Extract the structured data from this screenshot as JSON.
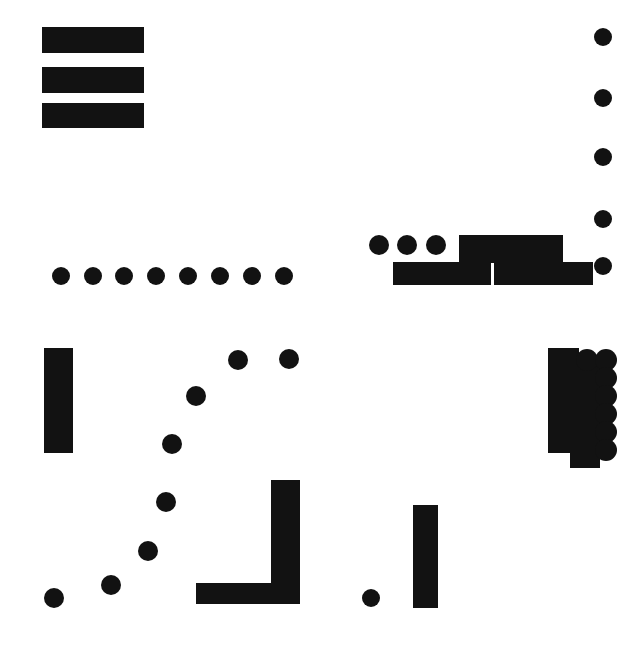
{
  "canvas": {
    "width": 642,
    "height": 649,
    "background_color": "#ffffff",
    "ink_color": "#121212",
    "description": "abstract black-on-white geometric composition of filled rectangles and filled circles"
  },
  "groups": [
    {
      "name": "top-left-bar-stack",
      "kind": "horizontal-bar-stack",
      "count": 3,
      "shapes": [
        {
          "type": "rect",
          "x": 42,
          "y": 27,
          "w": 102,
          "h": 26
        },
        {
          "type": "rect",
          "x": 42,
          "y": 67,
          "w": 102,
          "h": 26
        },
        {
          "type": "rect",
          "x": 42,
          "y": 103,
          "w": 102,
          "h": 25
        }
      ]
    },
    {
      "name": "right-edge-dot-column",
      "kind": "vertical-dot-column",
      "count": 5,
      "shapes": [
        {
          "type": "dot",
          "cx": 603,
          "cy": 37,
          "r": 9
        },
        {
          "type": "dot",
          "cx": 603,
          "cy": 98,
          "r": 9
        },
        {
          "type": "dot",
          "cx": 603,
          "cy": 157,
          "r": 9
        },
        {
          "type": "dot",
          "cx": 603,
          "cy": 219,
          "r": 9
        },
        {
          "type": "dot",
          "cx": 603,
          "cy": 266,
          "r": 9
        }
      ]
    },
    {
      "name": "middle-left-dot-row",
      "kind": "horizontal-dot-row",
      "count": 8,
      "shapes": [
        {
          "type": "dot",
          "cx": 61,
          "cy": 276,
          "r": 9
        },
        {
          "type": "dot",
          "cx": 93,
          "cy": 276,
          "r": 9
        },
        {
          "type": "dot",
          "cx": 124,
          "cy": 276,
          "r": 9
        },
        {
          "type": "dot",
          "cx": 156,
          "cy": 276,
          "r": 9
        },
        {
          "type": "dot",
          "cx": 188,
          "cy": 276,
          "r": 9
        },
        {
          "type": "dot",
          "cx": 220,
          "cy": 276,
          "r": 9
        },
        {
          "type": "dot",
          "cx": 252,
          "cy": 276,
          "r": 9
        },
        {
          "type": "dot",
          "cx": 284,
          "cy": 276,
          "r": 9
        }
      ]
    },
    {
      "name": "middle-right-bar-and-dot-cluster",
      "kind": "mixed-cluster",
      "count": 7,
      "shapes": [
        {
          "type": "dot",
          "cx": 379,
          "cy": 245,
          "r": 10
        },
        {
          "type": "dot",
          "cx": 407,
          "cy": 245,
          "r": 10
        },
        {
          "type": "dot",
          "cx": 436,
          "cy": 245,
          "r": 10
        },
        {
          "type": "rect",
          "x": 459,
          "y": 235,
          "w": 104,
          "h": 28
        },
        {
          "type": "rect",
          "x": 393,
          "y": 262,
          "w": 98,
          "h": 23
        },
        {
          "type": "rect",
          "x": 494,
          "y": 262,
          "w": 99,
          "h": 23
        }
      ]
    },
    {
      "name": "lower-left-vertical-bar",
      "kind": "vertical-bar",
      "count": 1,
      "shapes": [
        {
          "type": "rect",
          "x": 44,
          "y": 348,
          "w": 29,
          "h": 105
        }
      ]
    },
    {
      "name": "diagonal-dot-arc",
      "kind": "scatter-arc",
      "count": 8,
      "shapes": [
        {
          "type": "dot",
          "cx": 289,
          "cy": 359,
          "r": 10
        },
        {
          "type": "dot",
          "cx": 238,
          "cy": 360,
          "r": 10
        },
        {
          "type": "dot",
          "cx": 196,
          "cy": 396,
          "r": 10
        },
        {
          "type": "dot",
          "cx": 172,
          "cy": 444,
          "r": 10
        },
        {
          "type": "dot",
          "cx": 166,
          "cy": 502,
          "r": 10
        },
        {
          "type": "dot",
          "cx": 148,
          "cy": 551,
          "r": 10
        },
        {
          "type": "dot",
          "cx": 111,
          "cy": 585,
          "r": 10
        },
        {
          "type": "dot",
          "cx": 54,
          "cy": 598,
          "r": 10
        }
      ]
    },
    {
      "name": "bottom-center-l-shape",
      "kind": "l-shape",
      "count": 2,
      "shapes": [
        {
          "type": "rect",
          "x": 271,
          "y": 480,
          "w": 29,
          "h": 124
        },
        {
          "type": "rect",
          "x": 196,
          "y": 583,
          "w": 104,
          "h": 21
        }
      ]
    },
    {
      "name": "bottom-center-small-dot",
      "kind": "dot",
      "count": 1,
      "shapes": [
        {
          "type": "dot",
          "cx": 371,
          "cy": 598,
          "r": 9
        }
      ]
    },
    {
      "name": "bottom-right-vertical-bar",
      "kind": "vertical-bar",
      "count": 1,
      "shapes": [
        {
          "type": "rect",
          "x": 413,
          "y": 505,
          "w": 25,
          "h": 103
        }
      ]
    },
    {
      "name": "right-block-and-dot-column-cluster",
      "kind": "mixed-cluster",
      "count": 9,
      "shapes": [
        {
          "type": "rect",
          "x": 548,
          "y": 348,
          "w": 31,
          "h": 105
        },
        {
          "type": "rect",
          "x": 570,
          "y": 360,
          "w": 30,
          "h": 108
        },
        {
          "type": "dot",
          "cx": 587,
          "cy": 360,
          "r": 11
        },
        {
          "type": "dot",
          "cx": 606,
          "cy": 360,
          "r": 11
        },
        {
          "type": "dot",
          "cx": 606,
          "cy": 378,
          "r": 11
        },
        {
          "type": "dot",
          "cx": 606,
          "cy": 396,
          "r": 11
        },
        {
          "type": "dot",
          "cx": 606,
          "cy": 414,
          "r": 11
        },
        {
          "type": "dot",
          "cx": 606,
          "cy": 432,
          "r": 11
        },
        {
          "type": "dot",
          "cx": 606,
          "cy": 450,
          "r": 11
        }
      ]
    }
  ]
}
